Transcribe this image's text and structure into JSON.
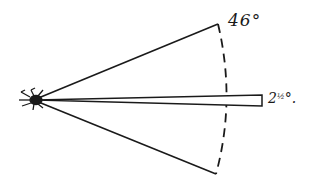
{
  "diagram": {
    "type": "angle-of-view sketch",
    "apex_figure": "spider",
    "wide_cone": {
      "angle_label": "46°"
    },
    "narrow_cone": {
      "angle_label_whole": "2",
      "angle_label_fraction": "½",
      "angle_label_suffix": "°."
    },
    "arc_style": "dashed",
    "colors": {
      "ink": "#1a1a1a",
      "background": "#ffffff"
    }
  }
}
